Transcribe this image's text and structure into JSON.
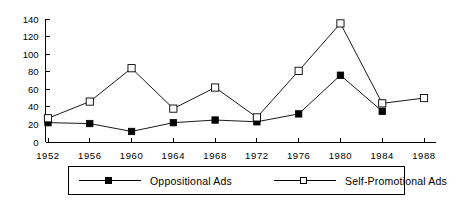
{
  "chart_data": {
    "type": "line",
    "title": "",
    "subtitle": "",
    "xlabel": "",
    "ylabel": "",
    "categories": [
      "1952",
      "1956",
      "1960",
      "1964",
      "1968",
      "1972",
      "1976",
      "1980",
      "1984",
      "1988"
    ],
    "series": [
      {
        "name": "Oppositional  Ads",
        "marker": "filled-square",
        "values": [
          22,
          21,
          12,
          22,
          25,
          23,
          32,
          76,
          35,
          null
        ]
      },
      {
        "name": "Self-Promotional  Ads",
        "marker": "open-square",
        "values": [
          27,
          46,
          84,
          38,
          62,
          28,
          81,
          135,
          44,
          50
        ]
      }
    ],
    "ylim": [
      0,
      140
    ],
    "yticks": [
      0,
      20,
      40,
      60,
      80,
      100,
      120,
      140
    ],
    "ytick_labels": [
      "0",
      "20",
      "40",
      "60",
      "80",
      "100",
      "120",
      "140"
    ],
    "xtick_labels": [
      "1952",
      "1956",
      "1960",
      "1964",
      "1968",
      "1972",
      "1976",
      "1980",
      "1984",
      "1988"
    ],
    "grid": false,
    "legend_position": "bottom",
    "colors": {
      "axis": "#000000",
      "series_line": "#000000",
      "filled_marker": "#000000",
      "open_marker": "#ffffff",
      "background": "#ffffff"
    }
  },
  "legend": {
    "entries": [
      {
        "label": "Oppositional  Ads",
        "marker": "filled-square"
      },
      {
        "label": "Self-Promotional  Ads",
        "marker": "open-square"
      }
    ]
  }
}
